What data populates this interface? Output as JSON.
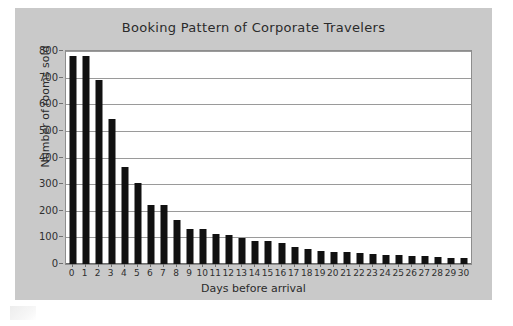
{
  "figure": {
    "panel_bg": "#c9c9c9",
    "plot_bg": "#ffffff",
    "bar_color": "#111111",
    "grid_color": "#9a9a9a",
    "text_color": "#2b2b2b"
  },
  "chart_data": {
    "type": "bar",
    "title": "Booking Pattern of Corporate Travelers",
    "xlabel": "Days before arrival",
    "ylabel": "Number of rooms sold",
    "categories": [
      "0",
      "1",
      "2",
      "3",
      "4",
      "5",
      "6",
      "7",
      "8",
      "9",
      "10",
      "11",
      "12",
      "13",
      "14",
      "15",
      "16",
      "17",
      "18",
      "19",
      "20",
      "21",
      "22",
      "23",
      "24",
      "25",
      "26",
      "27",
      "28",
      "29",
      "30"
    ],
    "values": [
      780,
      780,
      690,
      543,
      363,
      306,
      222,
      220,
      165,
      130,
      133,
      111,
      108,
      96,
      86,
      86,
      80,
      64,
      57,
      50,
      47,
      45,
      41,
      37,
      35,
      34,
      31,
      30,
      27,
      24,
      21
    ],
    "ylim": [
      0,
      800
    ],
    "yticks": [
      0,
      100,
      200,
      300,
      400,
      500,
      600,
      700,
      800
    ],
    "ytick_labels": [
      "0",
      "100",
      "200",
      "300",
      "400",
      "500",
      "600",
      "700",
      "800"
    ],
    "xticks": [
      "0",
      "1",
      "2",
      "3",
      "4",
      "5",
      "6",
      "7",
      "8",
      "9",
      "10",
      "11",
      "12",
      "13",
      "14",
      "15",
      "16",
      "17",
      "18",
      "19",
      "20",
      "21",
      "22",
      "23",
      "24",
      "25",
      "26",
      "27",
      "28",
      "29",
      "30"
    ],
    "grid": "horizontal",
    "legend": "none",
    "series_name": "Rooms sold"
  }
}
